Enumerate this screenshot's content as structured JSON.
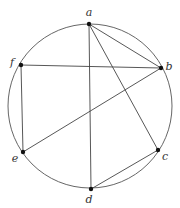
{
  "diagram": {
    "type": "graph-on-circle",
    "circle": {
      "cx": 90,
      "cy": 106,
      "r": 82
    },
    "vertices": [
      {
        "id": "a",
        "label": "a",
        "x": 89,
        "y": 24,
        "lx": 89,
        "ly": 16
      },
      {
        "id": "b",
        "label": "b",
        "x": 161,
        "y": 68,
        "lx": 169,
        "ly": 70
      },
      {
        "id": "c",
        "label": "c",
        "x": 158,
        "y": 150,
        "lx": 165,
        "ly": 160
      },
      {
        "id": "d",
        "label": "d",
        "x": 91,
        "y": 189,
        "lx": 89,
        "ly": 203
      },
      {
        "id": "e",
        "label": "e",
        "x": 23,
        "y": 152,
        "lx": 15,
        "ly": 162
      },
      {
        "id": "f",
        "label": "f",
        "x": 21,
        "y": 65,
        "lx": 12,
        "ly": 66
      }
    ],
    "edges": [
      [
        "a",
        "b"
      ],
      [
        "a",
        "c"
      ],
      [
        "a",
        "d"
      ],
      [
        "f",
        "b"
      ],
      [
        "f",
        "e"
      ],
      [
        "e",
        "b"
      ],
      [
        "d",
        "c"
      ]
    ]
  }
}
